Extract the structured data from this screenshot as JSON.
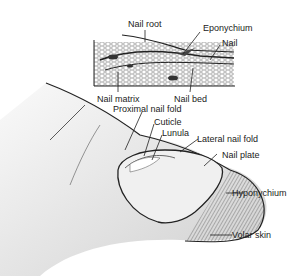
{
  "diagram": {
    "cross_section_labels": {
      "nail_root": "Nail root",
      "eponychium": "Eponychium",
      "nail": "Nail",
      "nail_matrix": "Nail matrix",
      "nail_bed": "Nail bed"
    },
    "finger_labels": {
      "proximal_nail_fold": "Proximal nail fold",
      "cuticle": "Cuticle",
      "lunula": "Lunula",
      "lateral_nail_fold": "Lateral nail fold",
      "nail_plate": "Nail plate",
      "hyponychium": "Hyponychium",
      "volar_skin": "Volar skin"
    }
  }
}
